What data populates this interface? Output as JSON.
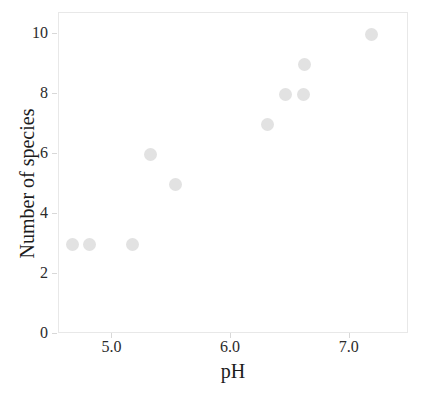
{
  "chart_data": {
    "type": "scatter",
    "title": "",
    "xlabel": "pH",
    "ylabel": "Number of species",
    "xlim": [
      4.55,
      7.5
    ],
    "ylim": [
      0,
      10.7
    ],
    "xticks": [
      5.0,
      6.0,
      7.0
    ],
    "xtick_labels": [
      "5.0",
      "6.0",
      "7.0"
    ],
    "yticks": [
      0,
      2,
      4,
      6,
      8,
      10
    ],
    "ytick_labels": [
      "0",
      "2",
      "4",
      "6",
      "8",
      "10"
    ],
    "grid": false,
    "legend": null,
    "marker_color": "#e2e2e2",
    "frame_color": "#e8e8e8",
    "x": [
      4.66,
      4.81,
      5.17,
      5.32,
      5.53,
      6.31,
      6.46,
      6.61,
      6.62,
      7.18
    ],
    "y": [
      3,
      3,
      3,
      6,
      5,
      7,
      8,
      8,
      9,
      10
    ],
    "points": [
      {
        "x": 4.66,
        "y": 3
      },
      {
        "x": 4.81,
        "y": 3
      },
      {
        "x": 5.17,
        "y": 3
      },
      {
        "x": 5.32,
        "y": 6
      },
      {
        "x": 5.53,
        "y": 5
      },
      {
        "x": 6.31,
        "y": 7
      },
      {
        "x": 6.46,
        "y": 8
      },
      {
        "x": 6.61,
        "y": 8
      },
      {
        "x": 6.62,
        "y": 9
      },
      {
        "x": 7.18,
        "y": 10
      }
    ]
  }
}
